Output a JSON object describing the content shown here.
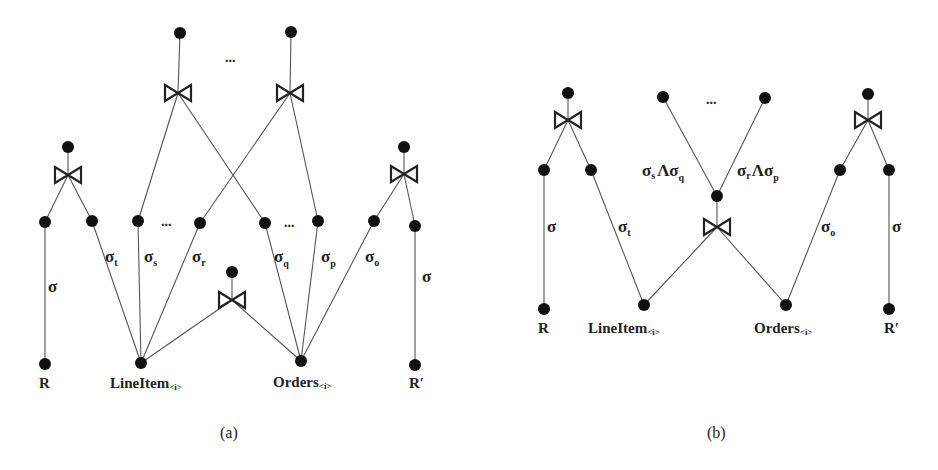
{
  "figure": {
    "panel_a": {
      "caption": "(a)",
      "relations": {
        "r": "R",
        "r_prime": "R′",
        "lineitem": "LineItem",
        "lineitem_sub": "<i>",
        "orders": "Orders",
        "orders_sub": "<i>"
      },
      "edge_labels": {
        "sigma_left": "σ",
        "sigma_t": {
          "base": "σ",
          "sub": "t"
        },
        "sigma_s": {
          "base": "σ",
          "sub": "s"
        },
        "sigma_r": {
          "base": "σ",
          "sub": "r"
        },
        "sigma_q": {
          "base": "σ",
          "sub": "q"
        },
        "sigma_p": {
          "base": "σ",
          "sub": "p"
        },
        "sigma_o": {
          "base": "σ",
          "sub": "o"
        },
        "sigma_right": "σ"
      },
      "ellipses": [
        "...",
        "...",
        "..."
      ]
    },
    "panel_b": {
      "caption": "(b)",
      "relations": {
        "r": "R",
        "r_prime": "R′",
        "lineitem": "LineItem",
        "lineitem_sub": "<i>",
        "orders": "Orders",
        "orders_sub": "<i>"
      },
      "edge_labels": {
        "sigma_left": "σ",
        "sigma_t": {
          "base": "σ",
          "sub": "t"
        },
        "sigma_s_and_q": {
          "a": "σ",
          "a_sub": "s",
          "op": "Λ",
          "b": "σ",
          "b_sub": "q"
        },
        "sigma_r_and_p": {
          "a": "σ",
          "a_sub": "r",
          "op": "Λ",
          "b": "σ",
          "b_sub": "p"
        },
        "sigma_o": {
          "base": "σ",
          "sub": "o"
        },
        "sigma_right": "σ"
      },
      "ellipses": [
        "..."
      ]
    },
    "symbols": {
      "join": "bowtie-join-icon",
      "node": "filled-circle-node"
    },
    "colors": {
      "background": "#ffffff",
      "edge": "#555555",
      "node": "#111111",
      "text": "#222222"
    }
  }
}
